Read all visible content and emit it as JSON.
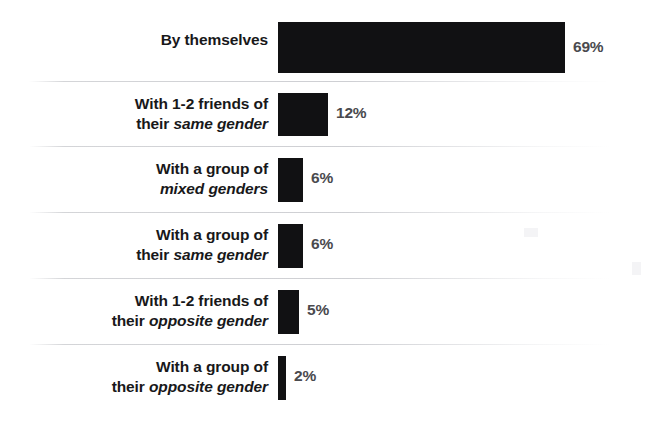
{
  "chart_data": {
    "type": "bar",
    "orientation": "horizontal",
    "title": "",
    "subtitle": "",
    "xlabel": "",
    "ylabel": "",
    "xlim": [
      0,
      69
    ],
    "grid": false,
    "legend": false,
    "value_suffix": "%",
    "categories": [
      "By themselves",
      "With 1-2 friends of their same gender",
      "With a group of mixed genders",
      "With a group of their same gender",
      "With 1-2 friends of their opposite gender",
      "With a group of their opposite gender"
    ],
    "values": [
      69,
      12,
      6,
      6,
      5,
      2
    ],
    "value_labels": [
      "69%",
      "12%",
      "6%",
      "6%",
      "5%",
      "2%"
    ],
    "bar_color": "#111113",
    "label_color": "#18181a",
    "value_color": "#4a4a4e",
    "background_color": "#ffffff",
    "rows": [
      {
        "line1": "By themselves",
        "line1_italic": false,
        "line2": "",
        "line2_italic": false,
        "value": 69,
        "value_label": "69%"
      },
      {
        "line1": "With 1-2 friends of",
        "line1_italic": false,
        "line2_plain": "their ",
        "line2_italic_text": "same gender",
        "value": 12,
        "value_label": "12%"
      },
      {
        "line1": "With a group of",
        "line1_italic": false,
        "line2_plain": "",
        "line2_italic_text": "mixed genders",
        "value": 6,
        "value_label": "6%"
      },
      {
        "line1": "With a group of",
        "line1_italic": false,
        "line2_plain": "their ",
        "line2_italic_text": "same gender",
        "value": 6,
        "value_label": "6%"
      },
      {
        "line1": "With 1-2 friends of",
        "line1_italic": false,
        "line2_plain": "their ",
        "line2_italic_text": "opposite gender",
        "value": 5,
        "value_label": "5%"
      },
      {
        "line1": "With a group of",
        "line1_italic": false,
        "line2_plain": "their ",
        "line2_italic_text": "opposite gender",
        "value": 2,
        "value_label": "2%"
      }
    ]
  },
  "layout": {
    "bar_origin_x": 278,
    "px_per_percent": 4.16,
    "row_tops": [
      8,
      82,
      147,
      213,
      279,
      345
    ],
    "row_height": 66,
    "separator_ys": [
      81,
      146,
      212,
      278,
      344
    ]
  }
}
